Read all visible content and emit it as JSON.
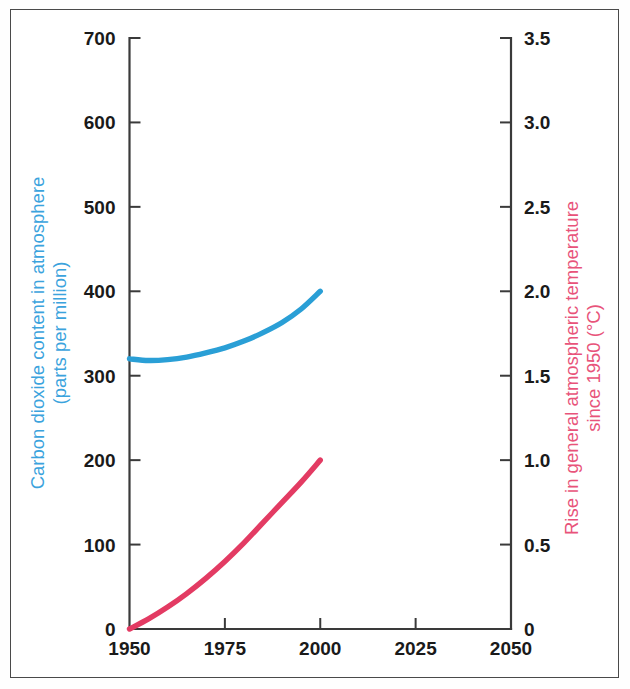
{
  "chart_data": {
    "type": "line",
    "title": "",
    "subtitle": "",
    "xlabel": "",
    "x_ticks": [
      "1950",
      "1975",
      "2000",
      "2025",
      "2050"
    ],
    "x_tick_values": [
      1950,
      1975,
      2000,
      2025,
      2050
    ],
    "xlim": [
      1950,
      2050
    ],
    "grid": false,
    "legend": "none",
    "axes": [
      {
        "id": "left",
        "side": "left",
        "label": "Carbon dioxide content in atmosphere\n(parts per million)",
        "label_line1": "Carbon dioxide content in atmosphere",
        "label_line2": "(parts per million)",
        "color": "#3ba3dd",
        "ticks": [
          "0",
          "100",
          "200",
          "300",
          "400",
          "500",
          "600",
          "700"
        ],
        "tick_values": [
          0,
          100,
          200,
          300,
          400,
          500,
          600,
          700
        ],
        "ylim": [
          0,
          700
        ]
      },
      {
        "id": "right",
        "side": "right",
        "label": "Rise in general atmospheric temperature\nsince 1950 (°C)",
        "label_line1": "Rise in general atmospheric temperature",
        "label_line2": "since 1950 (°C)",
        "color": "#e8537a",
        "ticks": [
          "0",
          "0.5",
          "1.0",
          "1.5",
          "2.0",
          "2.5",
          "3.0",
          "3.5"
        ],
        "tick_values": [
          0,
          0.5,
          1.0,
          1.5,
          2.0,
          2.5,
          3.0,
          3.5
        ],
        "ylim": [
          0,
          3.5
        ]
      }
    ],
    "series": [
      {
        "name": "Carbon dioxide content in atmosphere",
        "axis": "left",
        "unit": "parts per million",
        "color": "#2a9fd6",
        "x": [
          1950,
          1955,
          1960,
          1965,
          1970,
          1975,
          1980,
          1985,
          1990,
          1995,
          2000
        ],
        "values": [
          320,
          318,
          319,
          322,
          327,
          333,
          341,
          351,
          363,
          379,
          400
        ]
      },
      {
        "name": "Rise in general atmospheric temperature since 1950",
        "axis": "right",
        "unit": "°C",
        "color": "#e33b63",
        "x": [
          1950,
          1955,
          1960,
          1965,
          1970,
          1975,
          1980,
          1985,
          1990,
          1995,
          2000
        ],
        "values": [
          0.0,
          0.06,
          0.13,
          0.21,
          0.3,
          0.4,
          0.51,
          0.63,
          0.75,
          0.87,
          1.0
        ]
      }
    ]
  },
  "colors": {
    "blue": "#2a9fd6",
    "blue_label": "#3ba3dd",
    "red": "#e33b63",
    "red_label": "#e8537a",
    "axis": "#3a3a3a",
    "frame": "#4a4a4a",
    "background": "#ffffff"
  }
}
